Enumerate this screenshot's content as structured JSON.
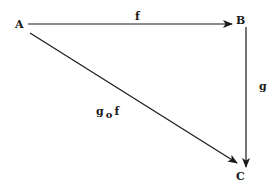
{
  "diagram": {
    "type": "commutative-diagram",
    "nodes": [
      {
        "id": "A",
        "label": "A"
      },
      {
        "id": "B",
        "label": "B"
      },
      {
        "id": "C",
        "label": "C"
      }
    ],
    "edges": [
      {
        "from": "A",
        "to": "B",
        "label": "f"
      },
      {
        "from": "B",
        "to": "C",
        "label": "g"
      },
      {
        "from": "A",
        "to": "C",
        "label": "g o f"
      }
    ],
    "composition": {
      "left": "g",
      "op": "o",
      "right": "f"
    },
    "colors": {
      "stroke": "#1a1a1a",
      "background": "#ffffff"
    }
  }
}
